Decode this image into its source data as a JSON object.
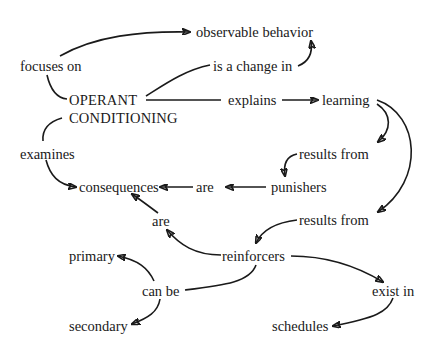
{
  "diagram": {
    "type": "concept-map",
    "central_concept": "OPERANT CONDITIONING",
    "nodes": {
      "observable_behavior": "observable behavior",
      "focuses_on": "focuses on",
      "is_a_change_in": "is a change in",
      "operant_line1": "OPERANT",
      "operant_line2": "CONDITIONING",
      "explains": "explains",
      "learning": "learning",
      "examines": "examines",
      "results_from_1": "results from",
      "consequences": "consequences",
      "are_1": "are",
      "punishers": "punishers",
      "are_2": "are",
      "results_from_2": "results from",
      "primary": "primary",
      "reinforcers": "reinforcers",
      "can_be": "can be",
      "exist_in": "exist in",
      "secondary": "secondary",
      "schedules": "schedules"
    },
    "propositions": [
      "OPERANT CONDITIONING focuses on observable behavior",
      "OPERANT CONDITIONING explains learning",
      "learning is a change in observable behavior",
      "OPERANT CONDITIONING examines consequences",
      "learning results from punishers",
      "punishers are consequences",
      "learning results from reinforcers",
      "reinforcers are consequences",
      "reinforcers can be primary",
      "reinforcers can be secondary",
      "reinforcers exist in schedules"
    ]
  }
}
